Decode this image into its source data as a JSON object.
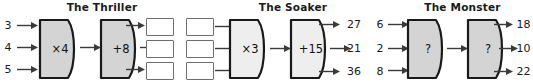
{
  "page": {
    "kind": "function-machine-worksheet",
    "background_color": "#ffffff",
    "width": 533,
    "height": 82
  },
  "style": {
    "machine_fill_dark": "#d4d4d4",
    "machine_fill_light": "#eeeeee",
    "machine_stroke": "#1a1a1a",
    "box_stroke": "#6e6e6e",
    "arrow_color": "#3a3a3a",
    "text_color": "#1a1a1a"
  },
  "sections": [
    {
      "id": "thriller",
      "title": "The Thriller",
      "inputs": [
        "3",
        "4",
        "5"
      ],
      "machines": [
        {
          "label": "×4",
          "shade": "dark"
        },
        {
          "label": "+8",
          "shade": "dark"
        }
      ],
      "outputs": [
        "",
        "",
        ""
      ],
      "output_kind": "empty-boxes"
    },
    {
      "id": "soaker",
      "title": "The Soaker",
      "inputs": [
        "",
        "",
        ""
      ],
      "input_kind": "empty-boxes",
      "machines": [
        {
          "label": "×3",
          "shade": "light"
        },
        {
          "label": "+15",
          "shade": "light"
        }
      ],
      "outputs": [
        "27",
        "21",
        "36"
      ],
      "output_kind": "numbers"
    },
    {
      "id": "monster",
      "title": "The Monster",
      "inputs": [
        "6",
        "2",
        "8"
      ],
      "machines": [
        {
          "label": "?",
          "shade": "dark"
        },
        {
          "label": "?",
          "shade": "dark"
        }
      ],
      "outputs": [
        "18",
        "10",
        "22"
      ],
      "output_kind": "numbers"
    }
  ]
}
